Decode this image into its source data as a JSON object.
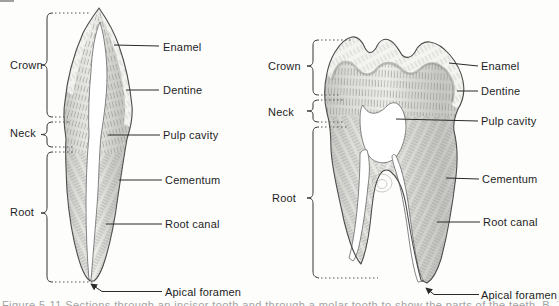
{
  "figure": {
    "background": "#fdfdfc",
    "ink_color": "#2a2a2a"
  },
  "left_tooth": {
    "region_labels": {
      "crown": "Crown",
      "neck": "Neck",
      "root": "Root"
    },
    "part_labels": {
      "enamel": "Enamel",
      "dentine": "Dentine",
      "pulp_cavity": "Pulp cavity",
      "cementum": "Cementum",
      "root_canal": "Root canal",
      "apical_foramen": "Apical foramen"
    }
  },
  "right_tooth": {
    "region_labels": {
      "crown": "Crown",
      "neck": "Neck",
      "root": "Root"
    },
    "part_labels": {
      "enamel": "Enamel",
      "dentine": "Dentine",
      "pulp_cavity": "Pulp cavity",
      "cementum": "Cementum",
      "root_canal": "Root canal",
      "apical_foramen": "Apical foramen"
    }
  },
  "caption": {
    "fragment": "Figure 5-11  Sections through an incisor tooth and through a molar tooth to show the parts of the teeth. B. Technical"
  }
}
